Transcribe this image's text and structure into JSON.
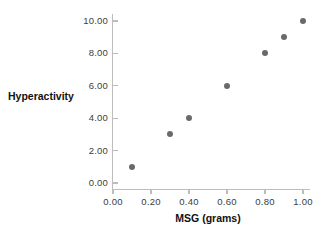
{
  "chart_data": {
    "type": "scatter",
    "title": "",
    "xlabel": "MSG (grams)",
    "ylabel": "Hyperactivity",
    "xlim": [
      0.0,
      1.0
    ],
    "ylim": [
      0.0,
      10.0
    ],
    "grid": false,
    "legend": null,
    "marker_color": "#6a6a6a",
    "axis_color": "#bdbdbd",
    "x": [
      0.1,
      0.3,
      0.4,
      0.6,
      0.8,
      0.9,
      1.0
    ],
    "y": [
      1.0,
      3.0,
      4.0,
      6.0,
      8.0,
      9.0,
      10.0
    ],
    "points": [
      {
        "x": 0.1,
        "y": 1.0
      },
      {
        "x": 0.3,
        "y": 3.0
      },
      {
        "x": 0.4,
        "y": 4.0
      },
      {
        "x": 0.6,
        "y": 6.0
      },
      {
        "x": 0.8,
        "y": 8.0
      },
      {
        "x": 0.9,
        "y": 9.0
      },
      {
        "x": 1.0,
        "y": 10.0
      }
    ],
    "xticks": [
      0.0,
      0.2,
      0.4,
      0.6,
      0.8,
      1.0
    ],
    "xticklabels": [
      "0.00",
      "0.20",
      "0.40",
      "0.60",
      "0.80",
      "1.00"
    ],
    "yticks": [
      0.0,
      2.0,
      4.0,
      6.0,
      8.0,
      10.0
    ],
    "yticklabels": [
      "0.00",
      "2.00",
      "4.00",
      "6.00",
      "8.00",
      "10.00"
    ]
  }
}
